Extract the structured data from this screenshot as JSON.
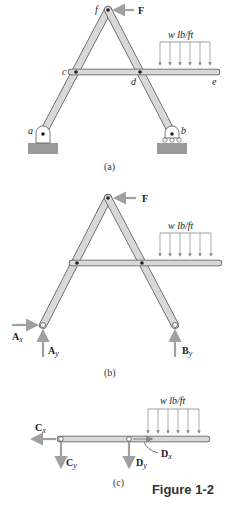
{
  "figure": {
    "caption": "Figure 1-2",
    "panels": [
      {
        "id": "a",
        "caption": "(a)",
        "points": [
          "a",
          "b",
          "c",
          "d",
          "e",
          "f"
        ],
        "force": "F",
        "load": "w lb/ft"
      },
      {
        "id": "b",
        "caption": "(b)",
        "force": "F",
        "load": "w lb/ft",
        "reactions": [
          "Ax",
          "Ay",
          "By"
        ]
      },
      {
        "id": "c",
        "caption": "(c)",
        "load": "w lb/ft",
        "forces": [
          "Cx",
          "Cy",
          "Dy",
          "Dx"
        ]
      }
    ]
  },
  "colors": {
    "member": "#d8d8d8",
    "outline": "#555555",
    "arrow": "#a0a0a0",
    "ground": "#9a9a9a"
  }
}
